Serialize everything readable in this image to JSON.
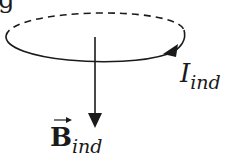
{
  "diagram": {
    "fragment_text": "g",
    "current_label": {
      "symbol": "I",
      "subscript": "ind"
    },
    "field_label": {
      "symbol": "B",
      "subscript": "ind",
      "vector_arrow": "→"
    },
    "colors": {
      "stroke": "#1a1a1a",
      "background": "#ffffff"
    }
  }
}
